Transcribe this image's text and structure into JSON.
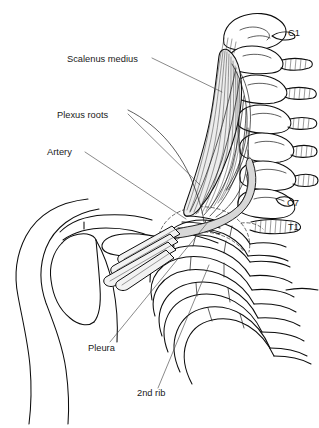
{
  "figure": {
    "background_color": "#ffffff",
    "ink_color": "#0d0d0d",
    "shade_color": "#d8d8d8",
    "width": 319,
    "height": 428
  },
  "labels": {
    "scalenus_medius": "Scalenus medius",
    "plexus_roots": "Plexus roots",
    "artery": "Artery",
    "pleura": "Pleura",
    "second_rib": "2nd rib"
  },
  "vertebra_labels": {
    "c1": "C1",
    "c7": "C7",
    "t1": "T1"
  },
  "label_positions": {
    "scalenus_medius": {
      "x": 67,
      "y": 62
    },
    "plexus_roots": {
      "x": 57,
      "y": 118
    },
    "artery": {
      "x": 47,
      "y": 155
    },
    "pleura": {
      "x": 88,
      "y": 351
    },
    "second_rib": {
      "x": 137,
      "y": 396
    },
    "c1": {
      "x": 288,
      "y": 36
    },
    "c7": {
      "x": 287,
      "y": 206
    },
    "t1": {
      "x": 288,
      "y": 230
    }
  },
  "leader_lines": [
    {
      "name": "scalenus-medius-leader",
      "from": [
        152,
        58
      ],
      "to": [
        222,
        92
      ]
    },
    {
      "name": "plexus-roots-leader",
      "from": [
        128,
        114
      ],
      "to": [
        200,
        185
      ]
    },
    {
      "name": "artery-leader",
      "from": [
        85,
        152
      ],
      "to": [
        186,
        219
      ]
    },
    {
      "name": "pleura-leader",
      "from": [
        110,
        342
      ],
      "to": [
        208,
        222
      ]
    },
    {
      "name": "second-rib-leader",
      "from": [
        158,
        388
      ],
      "to": [
        209,
        265
      ]
    }
  ],
  "structures": [
    {
      "name": "cervical-spine",
      "description": "C1 through T1 vertebrae with spinous processes, lateral view"
    },
    {
      "name": "scalenus-medius-muscle",
      "description": "striated muscle belly descending from upper cervical transverse processes"
    },
    {
      "name": "brachial-plexus-roots",
      "description": "nerve roots emerging between scalene muscles converging to trunks"
    },
    {
      "name": "subclavian-artery",
      "description": "shaded vessel band crossing the first rib"
    },
    {
      "name": "scapula-and-humeral-head",
      "description": "shoulder girdle outline with acromion and clavicle"
    },
    {
      "name": "rib-cage",
      "description": "ribs 1 through 5 with costal segments"
    },
    {
      "name": "pleural-dome",
      "description": "dashed cupola of the pleura over the apex of the lung"
    },
    {
      "name": "artery-cross-section",
      "description": "small circle marking a vessel in cross-section"
    }
  ]
}
